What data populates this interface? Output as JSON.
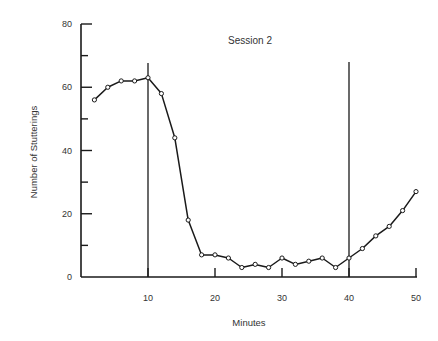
{
  "chart_data": {
    "type": "line",
    "title": "Session 2",
    "xlabel": "Minutes",
    "ylabel": "Number of Stutterings",
    "xlim": [
      0,
      50
    ],
    "ylim": [
      0,
      80
    ],
    "x_ticks": [
      10,
      20,
      30,
      40,
      50
    ],
    "x_tick_labels": [
      "10",
      "20",
      "30",
      "40",
      "50"
    ],
    "y_ticks_major": [
      0,
      20,
      40,
      60,
      80
    ],
    "y_tick_labels": [
      "0",
      "20",
      "40",
      "60",
      "80"
    ],
    "y_ticks_minor": [
      10,
      30,
      50,
      70
    ],
    "grid": false,
    "legend": null,
    "markers": "open-circle",
    "vertical_reference_lines": [
      10,
      40
    ],
    "series": [
      {
        "name": "Session 2",
        "x": [
          2,
          4,
          6,
          8,
          10,
          12,
          14,
          16,
          18,
          20,
          22,
          24,
          26,
          28,
          30,
          32,
          34,
          36,
          38,
          40,
          42,
          44,
          46,
          48,
          50
        ],
        "values": [
          56,
          60,
          62,
          62,
          63,
          58,
          44,
          18,
          7,
          7,
          6,
          3,
          4,
          3,
          6,
          4,
          5,
          6,
          3,
          6,
          9,
          13,
          16,
          21,
          27
        ]
      }
    ]
  },
  "colors": {
    "line": "#1a1a1a",
    "axis": "#1a1a1a",
    "background": "#ffffff"
  }
}
